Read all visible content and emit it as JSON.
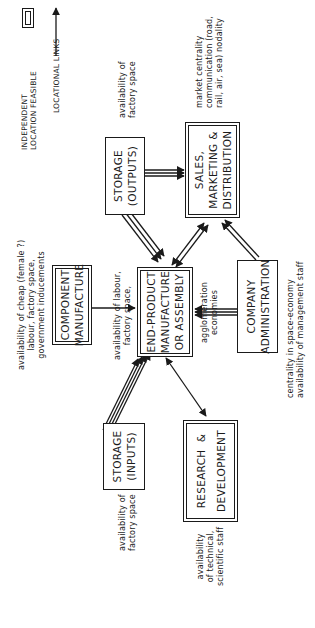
{
  "legend": {
    "items": [
      {
        "icon": "double-border-box-icon",
        "label_lines": [
          "INDEPENDENT",
          "LOCATION FEASIBLE"
        ]
      },
      {
        "icon": "arrow-icon",
        "label_lines": [
          "LOCATIONAL LINKS"
        ]
      }
    ]
  },
  "nodes": {
    "storage_outputs": {
      "lines": [
        "STORAGE",
        "(OUTPUTS)"
      ],
      "independent": false
    },
    "sales": {
      "lines": [
        "SALES,",
        "MARKETING &",
        "DISTRIBUTION"
      ],
      "independent": true
    },
    "component": {
      "lines": [
        "COMPONENT",
        "MANUFACTURE"
      ],
      "independent": true
    },
    "end_product": {
      "lines": [
        "END-PRODUCT",
        "MANUFACTURE",
        "OR ASSEMBLY"
      ],
      "independent": true
    },
    "admin": {
      "lines": [
        "COMPANY",
        "ADMINISTRATION"
      ],
      "independent": false
    },
    "storage_inputs": {
      "lines": [
        "STORAGE",
        "(INPUTS)"
      ],
      "independent": false
    },
    "rnd": {
      "lines": [
        "RESEARCH  &",
        "DEVELOPMENT"
      ],
      "independent": true
    }
  },
  "annotations": {
    "storage_outputs": [
      "availability of",
      "factory space"
    ],
    "sales": [
      "market centrality",
      "communication (road,",
      "rail, air, sea) nodality"
    ],
    "component": [
      "availability of cheap (female ?)",
      "labour, factory space,",
      "government inducements"
    ],
    "end_product": [
      "availability of labour,",
      "factory space,"
    ],
    "agglomeration": [
      "agglomeration",
      "economies"
    ],
    "admin": [
      "centrality in space-economy",
      "availability of management staff"
    ],
    "storage_inputs": [
      "availability of",
      "factory space"
    ],
    "rnd": [
      "availability",
      "of technical,",
      "scientific staff"
    ]
  },
  "links": [
    {
      "from": "storage_outputs",
      "to": "sales",
      "style": "triple"
    },
    {
      "from": "storage_outputs",
      "to": "end_product",
      "style": "triple"
    },
    {
      "from": "end_product",
      "to": "sales",
      "style": "double-bidirectional"
    },
    {
      "from": "admin",
      "to": "sales",
      "style": "double"
    },
    {
      "from": "component",
      "to": "end_product",
      "style": "single"
    },
    {
      "from": "admin",
      "to": "end_product",
      "style": "triple"
    },
    {
      "from": "storage_inputs",
      "to": "end_product",
      "style": "quadruple"
    },
    {
      "from": "end_product",
      "to": "rnd",
      "style": "single-bidirectional"
    }
  ]
}
